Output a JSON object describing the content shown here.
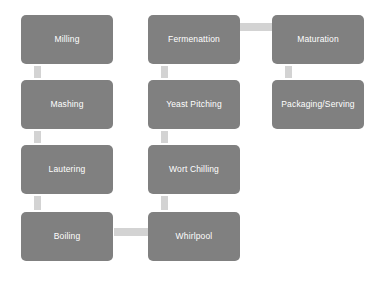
{
  "diagram": {
    "colors": {
      "node_fill": "#808080",
      "node_text": "#ffffff",
      "connector": "#d3d3d3",
      "background": "#ffffff"
    },
    "columns": [
      {
        "name": "mashing-column",
        "nodes": [
          {
            "id": "milling",
            "label": "Milling"
          },
          {
            "id": "mashing",
            "label": "Mashing"
          },
          {
            "id": "lautering",
            "label": "Lautering"
          },
          {
            "id": "boiling",
            "label": "Boiling"
          }
        ]
      },
      {
        "name": "fermentation-column",
        "nodes": [
          {
            "id": "fermentation",
            "label": "Fermenattion"
          },
          {
            "id": "yeast-pitching",
            "label": "Yeast Pitching"
          },
          {
            "id": "wort-chilling",
            "label": "Wort Chilling"
          },
          {
            "id": "whirlpool",
            "label": "Whirlpool"
          }
        ]
      },
      {
        "name": "finishing-column",
        "nodes": [
          {
            "id": "maturation",
            "label": "Maturation"
          },
          {
            "id": "packaging-serving",
            "label": "Packaging/Serving"
          }
        ]
      }
    ],
    "nodes": {
      "milling": "Milling",
      "mashing": "Mashing",
      "lautering": "Lautering",
      "boiling": "Boiling",
      "fermentation": "Fermenattion",
      "yeast_pitching": "Yeast Pitching",
      "wort_chilling": "Wort Chilling",
      "whirlpool": "Whirlpool",
      "maturation": "Maturation",
      "packaging_serving": "Packaging/Serving"
    },
    "edges": [
      {
        "id": "milling-mashing",
        "from": "Milling",
        "to": "Mashing",
        "orientation": "vertical"
      },
      {
        "id": "mashing-lautering",
        "from": "Mashing",
        "to": "Lautering",
        "orientation": "vertical"
      },
      {
        "id": "lautering-boiling",
        "from": "Lautering",
        "to": "Boiling",
        "orientation": "vertical"
      },
      {
        "id": "boiling-whirlpool",
        "from": "Boiling",
        "to": "Whirlpool",
        "orientation": "horizontal"
      },
      {
        "id": "whirlpool-wort-chilling",
        "from": "Whirlpool",
        "to": "Wort Chilling",
        "orientation": "vertical"
      },
      {
        "id": "wort-chilling-yeast-pitching",
        "from": "Wort Chilling",
        "to": "Yeast Pitching",
        "orientation": "vertical"
      },
      {
        "id": "yeast-pitching-fermentation",
        "from": "Yeast Pitching",
        "to": "Fermenattion",
        "orientation": "vertical"
      },
      {
        "id": "fermentation-maturation",
        "from": "Fermenattion",
        "to": "Maturation",
        "orientation": "horizontal"
      },
      {
        "id": "maturation-packaging",
        "from": "Maturation",
        "to": "Packaging/Serving",
        "orientation": "vertical"
      }
    ]
  }
}
